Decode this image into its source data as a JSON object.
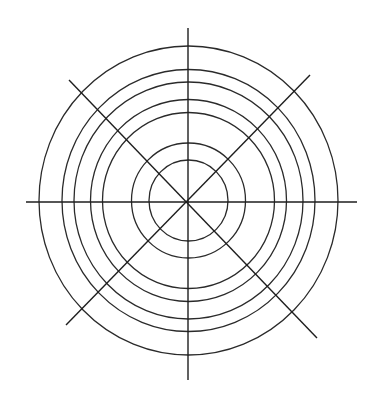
{
  "figure": {
    "background_color": "#ffffff",
    "stroke_color": "#2a2a2a",
    "center": {
      "x": 188.5,
      "y": 200.5
    },
    "rings": [
      {
        "rx": 39.5,
        "ry": 40.5
      },
      {
        "rx": 57,
        "ry": 57.5
      },
      {
        "rx": 86,
        "ry": 88
      },
      {
        "rx": 98,
        "ry": 101
      },
      {
        "rx": 114.5,
        "ry": 118.5
      },
      {
        "rx": 126.5,
        "ry": 131
      },
      {
        "rx": 149.5,
        "ry": 154.5
      }
    ],
    "spokes": [
      {
        "name": "vertical",
        "x1": 188,
        "y1": 28,
        "x2": 188,
        "y2": 380
      },
      {
        "name": "horizontal",
        "x1": 26,
        "y1": 202,
        "x2": 357,
        "y2": 202
      },
      {
        "name": "diagonal-down",
        "x1": 69,
        "y1": 80,
        "x2": 317,
        "y2": 338
      },
      {
        "name": "diagonal-up",
        "x1": 310,
        "y1": 75,
        "x2": 66,
        "y2": 325
      }
    ]
  }
}
